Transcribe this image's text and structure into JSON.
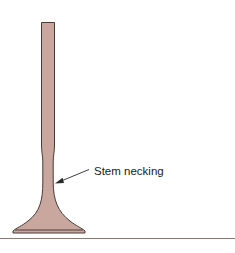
{
  "figure": {
    "annotations": [
      {
        "label": "Stem necking",
        "target": "valve-stem-narrowed-region"
      }
    ],
    "colors": {
      "valve_fill": "#c9a79f",
      "valve_outline": "#4a3a36",
      "arrow": "#2a2a2a",
      "rule": "#8a7a75"
    }
  }
}
